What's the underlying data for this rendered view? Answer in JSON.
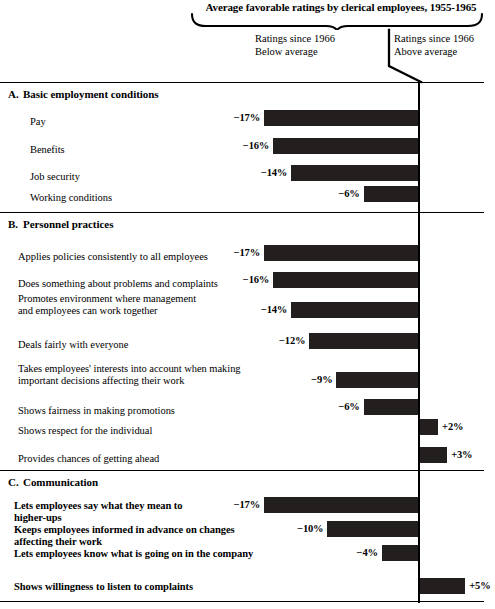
{
  "header": {
    "title": "Average favorable ratings by clerical employees, 1955-1965",
    "left_label_line1": "Ratings since 1966",
    "left_label_line2": "Below average",
    "right_label_line1": "Ratings since 1966",
    "right_label_line2": "Above average"
  },
  "chart_data": {
    "type": "bar",
    "orientation": "horizontal",
    "title": "Average favorable ratings by clerical employees, 1955-1965",
    "xlabel": "",
    "ylabel": "",
    "unit": "%",
    "grid": false,
    "legend": [
      "Ratings since 1966 Below average",
      "Ratings since 1966 Above average"
    ],
    "legend_position": "top",
    "axis_origin_note": "Bars extend left (negative) or right (positive) from a vertical zero line",
    "xlim": [
      -18,
      6
    ],
    "sections": [
      {
        "letter": "A.",
        "name": "Basic employment conditions",
        "categories": [
          "Pay",
          "Benefits",
          "Job security",
          "Working conditions"
        ],
        "values": [
          -17,
          -16,
          -14,
          -6
        ],
        "labels": [
          "−17%",
          "−16%",
          "−14%",
          "−6%"
        ]
      },
      {
        "letter": "B.",
        "name": "Personnel practices",
        "categories": [
          "Applies policies consistently to all employees",
          "Does something about problems and complaints",
          "Promotes environment where management\nand employees can work  together",
          "Deals fairly with everyone",
          "Takes employees' interests into account when making\nimportant decisions affecting their work",
          "Shows fairness in making promotions",
          "Shows respect for the individual",
          "Provides chances of getting ahead"
        ],
        "values": [
          -17,
          -16,
          -14,
          -12,
          -9,
          -6,
          2,
          3
        ],
        "labels": [
          "−17%",
          "−16%",
          "−14%",
          "−12%",
          "−9%",
          "−6%",
          "+2%",
          "+3%"
        ]
      },
      {
        "letter": "C.",
        "name": "Communication",
        "categories": [
          "Lets employees say what they mean to\nhigher-ups",
          "Keeps employees informed in advance on changes\naffecting their work",
          "Lets employees know what is going on in the company",
          "Shows willingness to listen to complaints"
        ],
        "values": [
          -17,
          -10,
          -4,
          5
        ],
        "labels": [
          "−17%",
          "−10%",
          "−4%",
          "+5%"
        ]
      }
    ]
  }
}
